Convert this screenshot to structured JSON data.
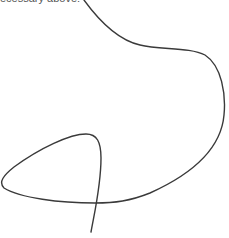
{
  "caption": {
    "text": "ecessary above:"
  },
  "drawing": {
    "stroke_color": "#3a3a3a",
    "stroke_width": 1.4,
    "path": "M 84 0 C 100 22, 118 40, 140 45 C 160 50, 190 47, 205 55 C 222 66, 226 95, 224 115 C 221 150, 190 175, 150 193 C 130 201, 115 203, 95 203 C 60 203, 20 198, 4 188 C -2 182, 4 175, 14 167 C 40 148, 70 134, 86 134 C 97 134, 101 142, 101 158 C 101 185, 95 210, 91 232"
  }
}
